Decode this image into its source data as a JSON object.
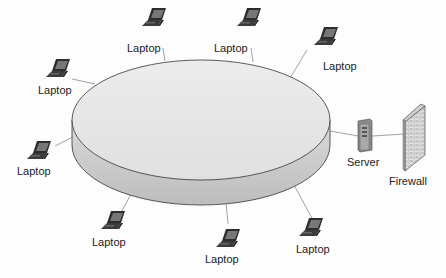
{
  "diagram": {
    "type": "network-topology",
    "center": {
      "name": "network-segment",
      "shape": "disc",
      "label": ""
    },
    "nodes": [
      {
        "id": "laptop-1",
        "type": "laptop",
        "label": "Laptop"
      },
      {
        "id": "laptop-2",
        "type": "laptop",
        "label": "Laptop"
      },
      {
        "id": "laptop-3",
        "type": "laptop",
        "label": "Laptop"
      },
      {
        "id": "laptop-4",
        "type": "laptop",
        "label": "Laptop"
      },
      {
        "id": "laptop-5",
        "type": "laptop",
        "label": "Laptop"
      },
      {
        "id": "laptop-6",
        "type": "laptop",
        "label": "Laptop"
      },
      {
        "id": "laptop-7",
        "type": "laptop",
        "label": "Laptop"
      },
      {
        "id": "laptop-8",
        "type": "laptop",
        "label": "Laptop"
      },
      {
        "id": "server",
        "type": "server",
        "label": "Server"
      },
      {
        "id": "firewall",
        "type": "firewall",
        "label": "Firewall"
      }
    ],
    "edges": [
      [
        "laptop-1",
        "network-segment"
      ],
      [
        "laptop-2",
        "network-segment"
      ],
      [
        "laptop-3",
        "network-segment"
      ],
      [
        "laptop-4",
        "network-segment"
      ],
      [
        "laptop-5",
        "network-segment"
      ],
      [
        "laptop-6",
        "network-segment"
      ],
      [
        "laptop-7",
        "network-segment"
      ],
      [
        "laptop-8",
        "network-segment"
      ],
      [
        "server",
        "network-segment"
      ],
      [
        "server",
        "firewall"
      ]
    ],
    "colors": {
      "disc_top": "#e6e6e6",
      "disc_side": "#c9c9c9",
      "outline": "#333333",
      "link": "#8a8a8a",
      "laptop_body": "#3a3a3a",
      "server_body": "#9a9a9a",
      "firewall_brick": "#d8d8d8"
    }
  }
}
